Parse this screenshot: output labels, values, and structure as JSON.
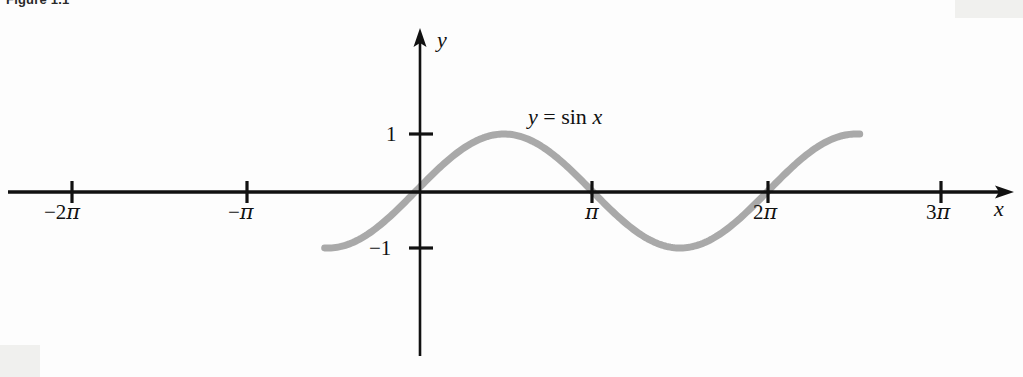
{
  "figure": {
    "caption": "Figure 1.1",
    "background_color": "#fdfdfd"
  },
  "axes": {
    "x_axis_name": "x",
    "y_axis_name": "y",
    "axis_color": "#111111",
    "x_ticks": [
      {
        "label_prefix": "−2",
        "label_symbol": "π",
        "value": -6.2832,
        "px": 72
      },
      {
        "label_prefix": "−",
        "label_symbol": "π",
        "value": -3.1416,
        "px": 247
      },
      {
        "label_prefix": "",
        "label_symbol": "π",
        "value": 3.1416,
        "px": 592
      },
      {
        "label_prefix": "2",
        "label_symbol": "π",
        "value": 6.2832,
        "px": 768
      },
      {
        "label_prefix": "3",
        "label_symbol": "π",
        "value": 9.4248,
        "px": 941
      }
    ],
    "y_ticks": [
      {
        "label": "1",
        "value": 1,
        "px": 134
      },
      {
        "label": "−1",
        "value": -1,
        "px": 248
      }
    ]
  },
  "curve": {
    "equation_y": "y",
    "equation_eq": " = ",
    "equation_fn": "sin",
    "equation_arg": "x",
    "color": "#a9a9a9",
    "stroke_width": 7
  },
  "chart_data": {
    "type": "line",
    "title": "",
    "xlabel": "x",
    "ylabel": "y",
    "legend": [
      "y = sin x"
    ],
    "grid": false,
    "xlim": [
      -7.6,
      11.0
    ],
    "ylim": [
      -1.9,
      3.2
    ],
    "xtick_values": [
      -6.2832,
      -3.1416,
      3.1416,
      6.2832,
      9.4248
    ],
    "xtick_labels": [
      "−2π",
      "−π",
      "π",
      "2π",
      "3π"
    ],
    "ytick_values": [
      1,
      -1
    ],
    "ytick_labels": [
      "1",
      "−1"
    ],
    "series": [
      {
        "name": "y = sin x",
        "function": "sin(x)",
        "x_domain": [
          -1.63,
          7.92
        ],
        "amplitude": 1,
        "period": 6.2832,
        "x": [
          -1.63,
          -1.2,
          -0.8,
          -0.4,
          0.0,
          0.4,
          0.8,
          1.2,
          1.5708,
          2.0,
          2.4,
          2.8,
          3.1416,
          3.5,
          3.9,
          4.3,
          4.7124,
          5.1,
          5.5,
          5.9,
          6.2832,
          6.7,
          7.1,
          7.5,
          7.92
        ],
        "y": [
          -0.998,
          -0.932,
          -0.717,
          -0.389,
          0.0,
          0.389,
          0.717,
          0.932,
          1.0,
          0.909,
          0.675,
          0.335,
          0.0,
          -0.351,
          -0.688,
          -0.916,
          -1.0,
          -0.926,
          -0.706,
          -0.374,
          0.0,
          0.405,
          0.729,
          0.938,
          0.999
        ]
      }
    ]
  }
}
